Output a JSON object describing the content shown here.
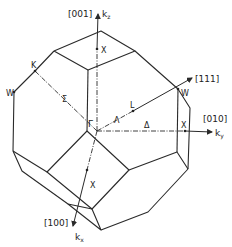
{
  "diagram": {
    "axes": {
      "z": {
        "direction": "[001]",
        "label": "k",
        "subscript": "z"
      },
      "y": {
        "direction": "[010]",
        "label": "k",
        "subscript": "y"
      },
      "x": {
        "direction": "[100]",
        "label": "k",
        "subscript": "x"
      },
      "diag": {
        "direction": "[111]"
      }
    },
    "points": {
      "gamma": "Γ",
      "x_top": "X",
      "x_right": "X",
      "x_front": "X",
      "k": "K",
      "w_left": "W",
      "w_right": "W",
      "l": "L"
    },
    "lines": {
      "sigma": "Σ",
      "lambda": "Λ",
      "delta": "Δ"
    },
    "colors": {
      "ink": "#2a2a2a",
      "background": "#ffffff"
    }
  }
}
